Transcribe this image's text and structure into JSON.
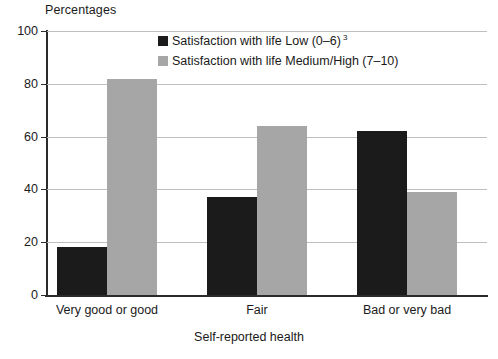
{
  "chart_data": {
    "type": "bar",
    "title": "",
    "ylabel": "Percentages",
    "xlabel": "Self-reported health",
    "categories": [
      "Very good or good",
      "Fair",
      "Bad or very bad"
    ],
    "series": [
      {
        "name": "Satisfaction with life Low (0–6)",
        "name_superscript": "3",
        "color": "#1b1b1b",
        "values": [
          18,
          37,
          62
        ]
      },
      {
        "name": "Satisfaction with life Medium/High (7–10)",
        "name_superscript": "",
        "color": "#a6a6a6",
        "values": [
          82,
          64,
          39
        ]
      }
    ],
    "ylim": [
      0,
      100
    ],
    "yticks": [
      0,
      20,
      40,
      60,
      80,
      100
    ],
    "ytick_labels": [
      "0",
      "20",
      "40",
      "60",
      "80",
      "100"
    ],
    "grid": true,
    "legend_position": "top-center"
  },
  "legend": {
    "items": [
      {
        "label": "Satisfaction with life Low (0–6)",
        "superscript": "3",
        "swatch": "#1b1b1b"
      },
      {
        "label": "Satisfaction with life Medium/High (7–10)",
        "superscript": "",
        "swatch": "#a6a6a6"
      }
    ]
  },
  "axes": {
    "y_title": "Percentages",
    "x_title": "Self-reported health"
  }
}
